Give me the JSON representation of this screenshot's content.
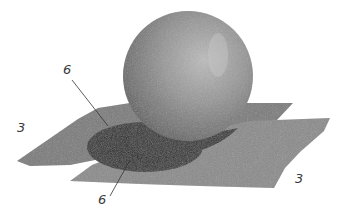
{
  "figure": {
    "colors": {
      "background": "#ffffff",
      "sphere_light": "#b8b8b8",
      "sphere_mid": "#8e8e8e",
      "sphere_dark": "#5e5e5e",
      "back_sheet": "#7a7a7a",
      "front_sheet": "#8a8a8a",
      "shadow": "#2e2e2e",
      "leader_line": "#333333",
      "label_text": "#3a3a3a"
    },
    "labels": [
      {
        "id": "label-top-left-6",
        "text": "6"
      },
      {
        "id": "label-bottom-6",
        "text": "6"
      },
      {
        "id": "label-left-3",
        "text": "3"
      },
      {
        "id": "label-right-3",
        "text": "3"
      }
    ]
  }
}
